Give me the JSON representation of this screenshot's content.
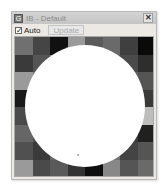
{
  "window": {
    "title": "IB - Default",
    "close_glyph": "✕",
    "app_icon_glyph": "G"
  },
  "toolbar": {
    "auto_checkbox": {
      "label": "Auto",
      "checked": true,
      "glyph": "✓"
    },
    "update_button": {
      "label": "Update",
      "enabled": false
    }
  },
  "canvas": {
    "grid_rows": 8,
    "grid_cols": 8,
    "cells": [
      [
        "#707070",
        "#454545",
        "#111111",
        "#9a9a9a",
        "#5a5a5a",
        "#6a6a6a",
        "#3f3f3f",
        "#0a0a0a"
      ],
      [
        "#3a3a3a",
        "#555555",
        "#7a7a7a",
        "#888888",
        "#606060",
        "#5a5a5a",
        "#4a4a4a",
        "#2e2e2e"
      ],
      [
        "#9a9a9a",
        "#7a7a7a",
        "#666666",
        "#555555",
        "#707070",
        "#606060",
        "#606060",
        "#555555"
      ],
      [
        "#1a1a1a",
        "#5a5a5a",
        "#777777",
        "#666666",
        "#555555",
        "#707070",
        "#505050",
        "#3a3a3a"
      ],
      [
        "#4a4a4a",
        "#666666",
        "#555555",
        "#707070",
        "#606060",
        "#555555",
        "#777777",
        "#bdbdbd"
      ],
      [
        "#666666",
        "#505050",
        "#707070",
        "#5a5a5a",
        "#666666",
        "#505050",
        "#3a3a3a",
        "#202020"
      ],
      [
        "#505050",
        "#3a3a3a",
        "#666666",
        "#555555",
        "#606060",
        "#707070",
        "#444444",
        "#555555"
      ],
      [
        "#9a9a9a",
        "#4a4a4a",
        "#5a5a5a",
        "#333333",
        "#0e0e0e",
        "#888888",
        "#555555",
        "#6a6a6a"
      ]
    ],
    "circle_color": "#ffffff"
  }
}
